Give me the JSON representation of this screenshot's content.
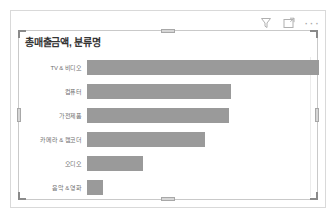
{
  "visual": {
    "title": "총매출금액, 분류명",
    "toolbar": {
      "filter_label": "필터",
      "filter_icon": "filter-funnel-icon",
      "focus_label": "포커스 모드",
      "focus_icon": "focus-mode-icon",
      "more_label": "추가 옵션",
      "more_icon": "more-options-ellipsis-icon",
      "more_glyph": "···"
    },
    "colors": {
      "bar": "#9a9a9a",
      "label": "#707070",
      "title": "#333333",
      "card_border": "#d9d9d9",
      "visual_border": "#c9c9c9",
      "handle": "#8a8a8a",
      "background": "#ffffff"
    }
  },
  "chart_data": {
    "type": "bar",
    "orientation": "horizontal",
    "title": "총매출금액, 분류명",
    "xlabel": "",
    "ylabel": "",
    "grid": false,
    "legend": false,
    "axis_labels_visible": false,
    "categories": [
      "TV & 비디오",
      "컴퓨터",
      "가전제품",
      "카메라 & 캠코더",
      "오디오",
      "음악 & 영화"
    ],
    "values": [
      100,
      62,
      61,
      51,
      24,
      7
    ],
    "value_unit": "relative percent of max",
    "bars": [
      {
        "category": "TV & 비디오",
        "value": 100,
        "pct": "100%"
      },
      {
        "category": "컴퓨터",
        "value": 62,
        "pct": "62%"
      },
      {
        "category": "가전제품",
        "value": 61,
        "pct": "61%"
      },
      {
        "category": "카메라 & 캠코더",
        "value": 51,
        "pct": "51%"
      },
      {
        "category": "오디오",
        "value": 24,
        "pct": "24%"
      },
      {
        "category": "음악 & 영화",
        "value": 7,
        "pct": "7%"
      }
    ],
    "xlim": [
      0,
      100
    ]
  }
}
